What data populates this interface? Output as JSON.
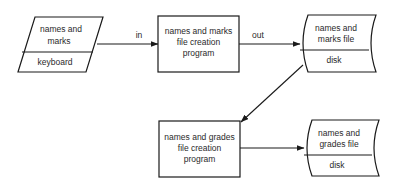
{
  "diagram": {
    "type": "flowchart",
    "nodes": {
      "keyboard_input": {
        "shape": "parallelogram",
        "label_line1": "names and",
        "label_line2": "marks",
        "sublabel": "keyboard"
      },
      "marks_program": {
        "shape": "rectangle",
        "label_line1": "names and marks",
        "label_line2": "file creation",
        "label_line3": "program"
      },
      "marks_file": {
        "shape": "disk-storage",
        "label_line1": "names and",
        "label_line2": "marks file",
        "sublabel": "disk"
      },
      "grades_program": {
        "shape": "rectangle",
        "label_line1": "names and grades",
        "label_line2": "file creation",
        "label_line3": "program"
      },
      "grades_file": {
        "shape": "disk-storage",
        "label_line1": "names and",
        "label_line2": "grades file",
        "sublabel": "disk"
      }
    },
    "edges": {
      "keyboard_to_marks_program": {
        "label": "in"
      },
      "marks_program_to_marks_file": {
        "label": "out"
      },
      "marks_file_to_grades_program": {
        "label": ""
      },
      "grades_program_to_grades_file": {
        "label": ""
      }
    },
    "colors": {
      "stroke": "#1a1a1a",
      "text": "#2a2a2a",
      "background": "#ffffff"
    }
  }
}
